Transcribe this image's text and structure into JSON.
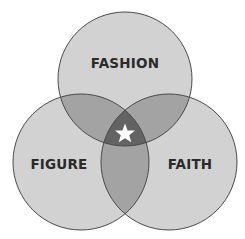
{
  "diagram": {
    "type": "venn",
    "sets": [
      {
        "id": "fashion",
        "label": "FASHION",
        "cx": 125,
        "cy": 79,
        "r": 67
      },
      {
        "id": "figure",
        "label": "FIGURE",
        "cx": 81,
        "cy": 162,
        "r": 68
      },
      {
        "id": "faith",
        "label": "FAITH",
        "cx": 169,
        "cy": 162,
        "r": 68
      }
    ],
    "center_marker": "star-icon",
    "colors": {
      "single": "#d2d2d2",
      "double": "#a3a3a3",
      "triple": "#636363",
      "stroke": "#4a4a4a",
      "star": "#ffffff"
    }
  }
}
